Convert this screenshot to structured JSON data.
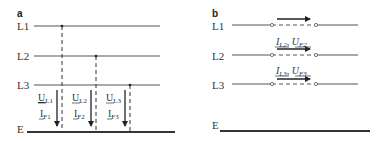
{
  "panels": {
    "a": {
      "label": "a",
      "lines": [
        "L1",
        "L2",
        "L3",
        "E"
      ],
      "faults": [
        {
          "u_main": "U",
          "u_sub": "L1",
          "i_main": "I",
          "i_sub": "F1"
        },
        {
          "u_main": "U",
          "u_sub": "L2",
          "i_main": "I",
          "i_sub": "F2"
        },
        {
          "u_main": "U",
          "u_sub": "L3",
          "i_main": "I",
          "i_sub": "F3"
        }
      ]
    },
    "b": {
      "label": "b",
      "lines": [
        "L1",
        "L2",
        "L3",
        "E"
      ],
      "annotations": [
        {
          "i_main": "I",
          "i_sub": "L2",
          "sep": ", ",
          "u_main": "U",
          "u_sub": "F2"
        },
        {
          "i_main": "I",
          "i_sub": "L3",
          "sep": ", ",
          "u_main": "U",
          "u_sub": "F3"
        }
      ]
    }
  },
  "colors": {
    "line": "#555555",
    "ground": "#333333",
    "arrow": "#222222"
  }
}
